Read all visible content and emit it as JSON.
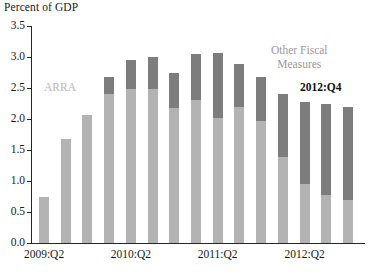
{
  "chart_data": {
    "type": "bar",
    "stacked": true,
    "title": "",
    "ylabel": "Percent of GDP",
    "xlabel": "",
    "ylim": [
      0.0,
      3.5
    ],
    "yticks": [
      "0.0",
      "0.5",
      "1.0",
      "1.5",
      "2.0",
      "2.5",
      "3.0",
      "3.5"
    ],
    "ytick_values": [
      0.0,
      0.5,
      1.0,
      1.5,
      2.0,
      2.5,
      3.0,
      3.5
    ],
    "grid": false,
    "legend_position": "inline-annotations",
    "categories": [
      "2009:Q2",
      "2009:Q3",
      "2009:Q4",
      "2010:Q1",
      "2010:Q2",
      "2010:Q3",
      "2010:Q4",
      "2011:Q1",
      "2011:Q2",
      "2011:Q3",
      "2011:Q4",
      "2012:Q1",
      "2012:Q2",
      "2012:Q3",
      "2012:Q4"
    ],
    "xtick_labels": [
      "2009:Q2",
      "2010:Q2",
      "2011:Q2",
      "2012:Q2"
    ],
    "xtick_indices": [
      0,
      4,
      8,
      12
    ],
    "series": [
      {
        "name": "ARRA",
        "color": "#b3b3b3",
        "values": [
          0.75,
          1.67,
          2.06,
          2.4,
          2.48,
          2.48,
          2.18,
          2.3,
          2.02,
          2.2,
          1.96,
          1.38,
          0.95,
          0.78,
          0.7
        ]
      },
      {
        "name": "Other Fiscal Measures",
        "color": "#7d7d7d",
        "values": [
          0.0,
          0.0,
          0.0,
          0.28,
          0.47,
          0.52,
          0.56,
          0.75,
          1.04,
          0.68,
          0.71,
          1.02,
          1.33,
          1.47,
          1.5
        ]
      }
    ],
    "totals": [
      0.75,
      1.67,
      2.06,
      2.68,
      2.95,
      3.0,
      2.74,
      3.05,
      3.06,
      2.88,
      2.67,
      2.4,
      2.28,
      2.25,
      2.2
    ],
    "annotations": [
      {
        "name": "arra-label",
        "text": "ARRA",
        "color": "#b9b9b9"
      },
      {
        "name": "other-fiscal-measures-label",
        "line1": "Other Fiscal",
        "line2": "Measures",
        "color": "#9a9a9a"
      },
      {
        "name": "last-observation-label",
        "text": "2012:Q4",
        "color": "#111111"
      }
    ]
  },
  "axis": {
    "y_title": "Percent of GDP"
  }
}
